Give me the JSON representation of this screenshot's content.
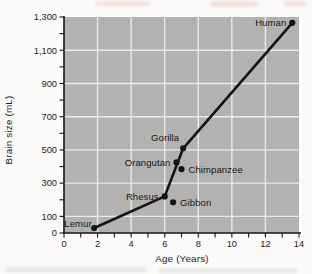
{
  "chart_data": {
    "type": "scatter",
    "title": "",
    "xlabel": "Age (Years)",
    "ylabel": "Brain size (mL)",
    "xlim": [
      0,
      14
    ],
    "ylim": [
      0,
      1300
    ],
    "x_major_ticks": [
      0,
      2,
      4,
      6,
      8,
      10,
      12,
      14
    ],
    "x_minor_tick_step": 1,
    "y_tick_step": 100,
    "y_labeled_ticks": [
      {
        "v": 0,
        "label": "0"
      },
      {
        "v": 100,
        "label": "100"
      },
      {
        "v": 300,
        "label": "300"
      },
      {
        "v": 500,
        "label": "500"
      },
      {
        "v": 700,
        "label": "700"
      },
      {
        "v": 900,
        "label": "900"
      },
      {
        "v": 1100,
        "label": "1,100"
      },
      {
        "v": 1300,
        "label": "1,300"
      }
    ],
    "grid_x": [
      2,
      4,
      6,
      8,
      10,
      12
    ],
    "grid_y": [
      100,
      300,
      500,
      700,
      900,
      1100
    ],
    "legend": "none",
    "points": [
      {
        "name": "Lemur",
        "age": 1.8,
        "brain_ml": 30,
        "on_trend_line": true,
        "label_side": "left-up"
      },
      {
        "name": "Rhesus",
        "age": 6.0,
        "brain_ml": 220,
        "on_trend_line": true,
        "label_side": "left"
      },
      {
        "name": "Gibbon",
        "age": 6.5,
        "brain_ml": 185,
        "on_trend_line": false,
        "label_side": "right"
      },
      {
        "name": "Orangutan",
        "age": 6.7,
        "brain_ml": 425,
        "on_trend_line": false,
        "label_side": "left"
      },
      {
        "name": "Chimpanzee",
        "age": 7.0,
        "brain_ml": 385,
        "on_trend_line": false,
        "label_side": "right"
      },
      {
        "name": "Gorilla",
        "age": 7.1,
        "brain_ml": 510,
        "on_trend_line": true,
        "label_side": "above-left"
      },
      {
        "name": "Human",
        "age": 13.6,
        "brain_ml": 1265,
        "on_trend_line": true,
        "label_side": "left"
      }
    ],
    "colors": {
      "plot_bg": "#b3b2b1",
      "gridline": "#eceae7",
      "axis": "#161616",
      "trend_line": "#141414",
      "point": "#141414",
      "text": "#1c1c1c"
    }
  }
}
